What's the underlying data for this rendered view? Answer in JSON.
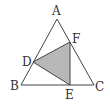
{
  "diagram": {
    "colors": {
      "stroke": "#444444",
      "fill": "#b8b8b8",
      "background": "#ffffff"
    },
    "points": {
      "A": {
        "label": "A",
        "x": 57,
        "y": 19,
        "lx": 52,
        "ly": 15
      },
      "B": {
        "label": "B",
        "x": 21,
        "y": 85,
        "lx": 10,
        "ly": 90
      },
      "C": {
        "label": "C",
        "x": 94,
        "y": 85,
        "lx": 95,
        "ly": 91
      },
      "D": {
        "label": "D",
        "x": 33,
        "y": 62,
        "lx": 22,
        "ly": 66
      },
      "E": {
        "label": "E",
        "x": 70,
        "y": 85,
        "lx": 65,
        "ly": 99
      },
      "F": {
        "label": "F",
        "x": 70,
        "y": 42,
        "lx": 72,
        "ly": 43
      }
    }
  }
}
